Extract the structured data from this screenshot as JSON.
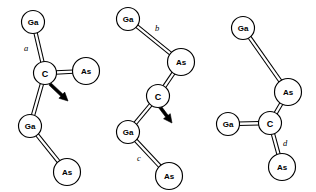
{
  "figure": {
    "background_color": "#ffffff",
    "line_color": "#000000",
    "width": 316,
    "height": 192
  },
  "panels": [
    {
      "id": "panel-a",
      "dimension_label": "a",
      "dimension_label_pos": {
        "x": 26,
        "y": 48
      },
      "has_arrow": true,
      "arrow": {
        "x1": 50,
        "y1": 84,
        "x2": 68,
        "y2": 101
      },
      "atoms": [
        {
          "id": "a-ga-top",
          "label": "Ga",
          "x": 33,
          "y": 22,
          "r": 11.5,
          "element": "gallium"
        },
        {
          "id": "a-c",
          "label": "C",
          "x": 45,
          "y": 73,
          "r": 11.5,
          "element": "carbon"
        },
        {
          "id": "a-as-right",
          "label": "As",
          "x": 86,
          "y": 71,
          "r": 13.5,
          "element": "arsenic"
        },
        {
          "id": "a-ga-low",
          "label": "Ga",
          "x": 30,
          "y": 126,
          "r": 11.5,
          "element": "gallium"
        },
        {
          "id": "a-as-bot",
          "label": "As",
          "x": 67,
          "y": 172,
          "r": 13.5,
          "element": "arsenic"
        }
      ],
      "bonds": [
        {
          "from": "a-ga-top",
          "to": "a-c",
          "type": "double"
        },
        {
          "from": "a-c",
          "to": "a-as-right",
          "type": "double"
        },
        {
          "from": "a-c",
          "to": "a-ga-low",
          "type": "double"
        },
        {
          "from": "a-ga-low",
          "to": "a-as-bot",
          "type": "double"
        }
      ]
    },
    {
      "id": "panel-b",
      "dimension_label": "b",
      "dimension_label_pos": {
        "x": 157,
        "y": 28
      },
      "dimension_label_2": "c",
      "dimension_label_2_pos": {
        "x": 139,
        "y": 158
      },
      "has_arrow": true,
      "arrow": {
        "x1": 160,
        "y1": 107,
        "x2": 172,
        "y2": 123
      },
      "atoms": [
        {
          "id": "b-ga-top",
          "label": "Ga",
          "x": 128,
          "y": 19,
          "r": 11.5,
          "element": "gallium"
        },
        {
          "id": "b-as-up",
          "label": "As",
          "x": 181,
          "y": 62,
          "r": 13.5,
          "element": "arsenic"
        },
        {
          "id": "b-c",
          "label": "C",
          "x": 158,
          "y": 96,
          "r": 11.5,
          "element": "carbon"
        },
        {
          "id": "b-ga-low",
          "label": "Ga",
          "x": 128,
          "y": 132,
          "r": 11.5,
          "element": "gallium"
        },
        {
          "id": "b-as-bot",
          "label": "As",
          "x": 169,
          "y": 176,
          "r": 13.5,
          "element": "arsenic"
        }
      ],
      "bonds": [
        {
          "from": "b-ga-top",
          "to": "b-as-up",
          "type": "double"
        },
        {
          "from": "b-as-up",
          "to": "b-c",
          "type": "double"
        },
        {
          "from": "b-c",
          "to": "b-ga-low",
          "type": "double"
        },
        {
          "from": "b-ga-low",
          "to": "b-as-bot",
          "type": "double"
        }
      ]
    },
    {
      "id": "panel-c",
      "dimension_label": "d",
      "dimension_label_pos": {
        "x": 285,
        "y": 143
      },
      "has_arrow": false,
      "atoms": [
        {
          "id": "c-ga-top",
          "label": "Ga",
          "x": 243,
          "y": 28,
          "r": 11.5,
          "element": "gallium"
        },
        {
          "id": "c-as-up",
          "label": "As",
          "x": 288,
          "y": 92,
          "r": 13.5,
          "element": "arsenic"
        },
        {
          "id": "c-c",
          "label": "C",
          "x": 270,
          "y": 123,
          "r": 11.5,
          "element": "carbon"
        },
        {
          "id": "c-ga-left",
          "label": "Ga",
          "x": 228,
          "y": 124,
          "r": 11.5,
          "element": "gallium"
        },
        {
          "id": "c-as-bot",
          "label": "As",
          "x": 282,
          "y": 167,
          "r": 13.5,
          "element": "arsenic"
        }
      ],
      "bonds": [
        {
          "from": "c-ga-top",
          "to": "c-as-up",
          "type": "double"
        },
        {
          "from": "c-as-up",
          "to": "c-c",
          "type": "double"
        },
        {
          "from": "c-ga-left",
          "to": "c-c",
          "type": "double"
        },
        {
          "from": "c-c",
          "to": "c-as-bot",
          "type": "double"
        }
      ]
    }
  ]
}
